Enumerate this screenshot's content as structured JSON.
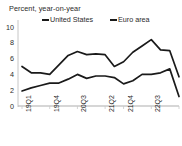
{
  "chart_data": {
    "type": "line",
    "title": "Percent, year-on-year",
    "xlabel": "",
    "ylabel": "",
    "ylim": [
      0,
      10
    ],
    "yticks": [
      0,
      2,
      4,
      6,
      8,
      10
    ],
    "ytick_labels": [
      "0",
      "2",
      "4",
      "6",
      "8",
      "10"
    ],
    "grid": false,
    "legend_position": "top",
    "x": [
      "19Q1",
      "19Q2",
      "19Q3",
      "19Q4",
      "20Q1",
      "20Q2",
      "20Q3",
      "20Q4",
      "21Q1",
      "21Q2",
      "21Q3",
      "21Q4",
      "22Q1",
      "22Q2",
      "22Q3",
      "22Q4",
      "23Q1",
      "23Q2"
    ],
    "xtick_labels": [
      "19Q1",
      "19Q4",
      "20Q3",
      "21Q2",
      "21Q4",
      "22Q3",
      "23Q2"
    ],
    "xtick_indices": [
      0,
      3,
      6,
      9,
      11,
      14,
      17
    ],
    "series": [
      {
        "name": "United States",
        "color": "#1a1a1a",
        "values": [
          5.0,
          4.2,
          4.2,
          4.0,
          5.2,
          6.4,
          6.9,
          6.5,
          6.6,
          6.5,
          5.0,
          5.6,
          6.8,
          7.6,
          8.4,
          7.1,
          7.0,
          3.7
        ]
      },
      {
        "name": "Euro area",
        "color": "#1a1a1a",
        "values": [
          1.9,
          2.3,
          2.6,
          2.9,
          2.9,
          3.4,
          4.0,
          3.5,
          3.8,
          3.8,
          3.6,
          2.8,
          3.2,
          4.0,
          4.0,
          4.2,
          4.7,
          1.2
        ]
      }
    ]
  },
  "legend": {
    "items": [
      {
        "label": "United States"
      },
      {
        "label": "Euro area"
      }
    ]
  }
}
